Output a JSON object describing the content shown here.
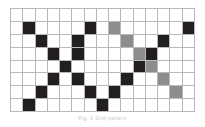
{
  "figure": {
    "kind": "grid-matrix-diagram",
    "caption": "Fig. 1  Grid pattern",
    "colors": {
      "background": "#ffffff",
      "gridline": "#b9b9b9",
      "black_cell": "#231f20",
      "gray_cell": "#8d8d8d"
    }
  },
  "chart_data": {
    "type": "heatmap",
    "title": "",
    "xlabel": "",
    "ylabel": "",
    "columns": 15,
    "rows": 8,
    "grid": true,
    "legend": [
      {
        "label": "filled",
        "value": 1,
        "color": "#231f20"
      },
      {
        "label": "partial",
        "value": 2,
        "color": "#8d8d8d"
      },
      {
        "label": "empty",
        "value": 0,
        "color": "#ffffff"
      }
    ],
    "values": [
      [
        0,
        0,
        0,
        0,
        0,
        0,
        0,
        0,
        0,
        0,
        0,
        0,
        0,
        0,
        0
      ],
      [
        0,
        1,
        0,
        0,
        0,
        0,
        1,
        0,
        2,
        0,
        0,
        0,
        0,
        0,
        1
      ],
      [
        0,
        0,
        1,
        0,
        0,
        1,
        0,
        0,
        0,
        2,
        0,
        0,
        1,
        0,
        0
      ],
      [
        0,
        0,
        0,
        1,
        0,
        1,
        0,
        0,
        0,
        0,
        2,
        1,
        0,
        0,
        0
      ],
      [
        0,
        0,
        0,
        0,
        1,
        0,
        0,
        0,
        0,
        0,
        1,
        2,
        0,
        0,
        0
      ],
      [
        0,
        0,
        0,
        1,
        0,
        1,
        0,
        0,
        0,
        1,
        0,
        0,
        2,
        0,
        0
      ],
      [
        0,
        0,
        1,
        0,
        0,
        0,
        1,
        0,
        1,
        0,
        0,
        0,
        0,
        2,
        0
      ],
      [
        0,
        1,
        0,
        0,
        0,
        0,
        0,
        1,
        0,
        0,
        0,
        0,
        0,
        0,
        0
      ]
    ]
  }
}
